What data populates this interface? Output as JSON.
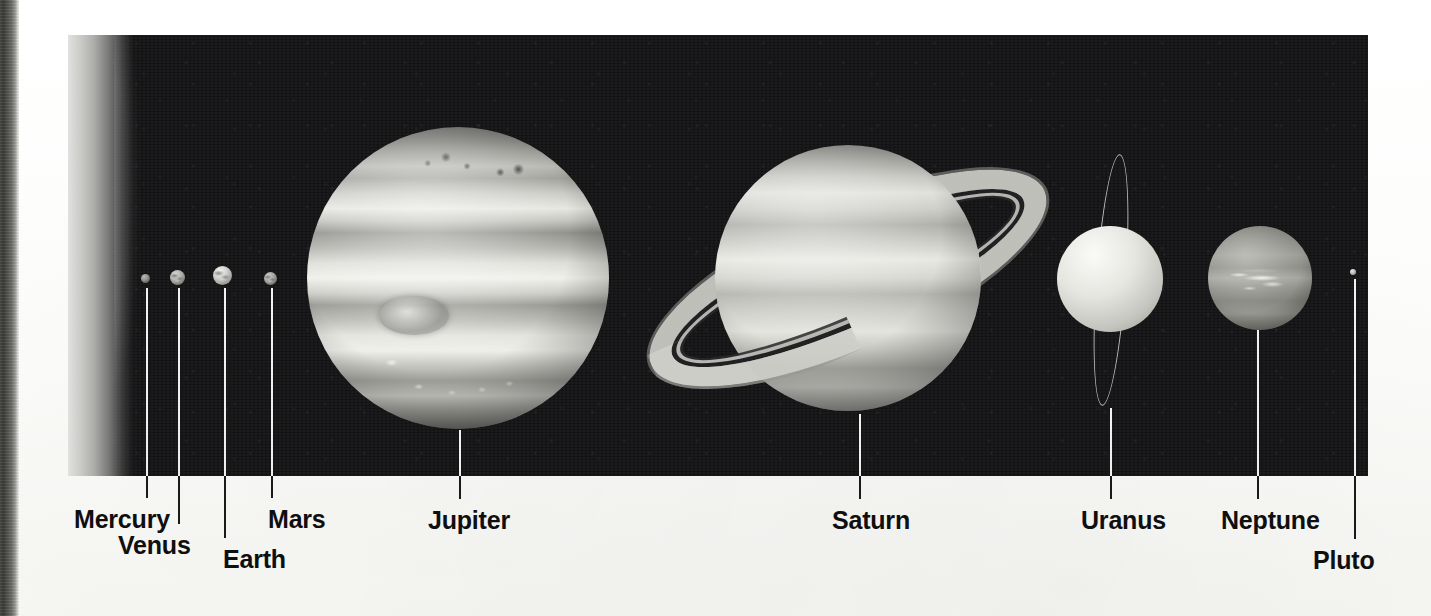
{
  "figure": {
    "kind": "solar-system-scale-photo-composite",
    "background_color": "#121214",
    "paper_color": "#fdfdfb"
  },
  "sun": {
    "name": "Sun",
    "note": "partial limb visible at left edge"
  },
  "planets": [
    {
      "id": "mercury",
      "label": "Mercury",
      "cx": 145,
      "cy": 278,
      "diameter": 9,
      "label_x": 74,
      "label_y": 505,
      "leader_x": 146,
      "leader_top": 288,
      "leader_bottom": 498,
      "icon": "mercury-planet-icon"
    },
    {
      "id": "venus",
      "label": "Venus",
      "cx": 177,
      "cy": 277,
      "diameter": 15,
      "label_x": 118,
      "label_y": 531,
      "leader_x": 178,
      "leader_top": 288,
      "leader_bottom": 524,
      "icon": "venus-planet-icon"
    },
    {
      "id": "earth",
      "label": "Earth",
      "cx": 222,
      "cy": 275,
      "diameter": 19,
      "label_x": 223,
      "label_y": 545,
      "leader_x": 224,
      "leader_top": 288,
      "leader_bottom": 538,
      "icon": "earth-planet-icon"
    },
    {
      "id": "mars",
      "label": "Mars",
      "cx": 270,
      "cy": 278,
      "diameter": 13,
      "label_x": 268,
      "label_y": 505,
      "leader_x": 271,
      "leader_top": 288,
      "leader_bottom": 498,
      "icon": "mars-planet-icon"
    },
    {
      "id": "jupiter",
      "label": "Jupiter",
      "cx": 458,
      "cy": 278,
      "diameter": 302,
      "label_x": 428,
      "label_y": 506,
      "leader_x": 459,
      "leader_top": 430,
      "leader_bottom": 499,
      "icon": "jupiter-planet-icon"
    },
    {
      "id": "saturn",
      "label": "Saturn",
      "cx": 848,
      "cy": 278,
      "diameter": 266,
      "ring_outer_w": 430,
      "ring_outer_h": 140,
      "ring_tilt_deg": -24,
      "label_x": 832,
      "label_y": 506,
      "leader_x": 859,
      "leader_top": 414,
      "leader_bottom": 499,
      "icon": "saturn-planet-icon"
    },
    {
      "id": "uranus",
      "label": "Uranus",
      "cx": 1110,
      "cy": 279,
      "diameter": 106,
      "ring_w": 28,
      "ring_h": 250,
      "ring_tilt_deg": 4,
      "label_x": 1081,
      "label_y": 506,
      "leader_x": 1110,
      "leader_top": 408,
      "leader_bottom": 499,
      "icon": "uranus-planet-icon"
    },
    {
      "id": "neptune",
      "label": "Neptune",
      "cx": 1260,
      "cy": 278,
      "diameter": 104,
      "label_x": 1221,
      "label_y": 506,
      "leader_x": 1257,
      "leader_top": 330,
      "leader_bottom": 499,
      "icon": "neptune-planet-icon"
    },
    {
      "id": "pluto",
      "label": "Pluto",
      "cx": 1353,
      "cy": 272,
      "diameter": 6,
      "label_x": 1313,
      "label_y": 546,
      "leader_x": 1354,
      "leader_top": 279,
      "leader_bottom": 539,
      "icon": "pluto-planet-icon"
    }
  ]
}
